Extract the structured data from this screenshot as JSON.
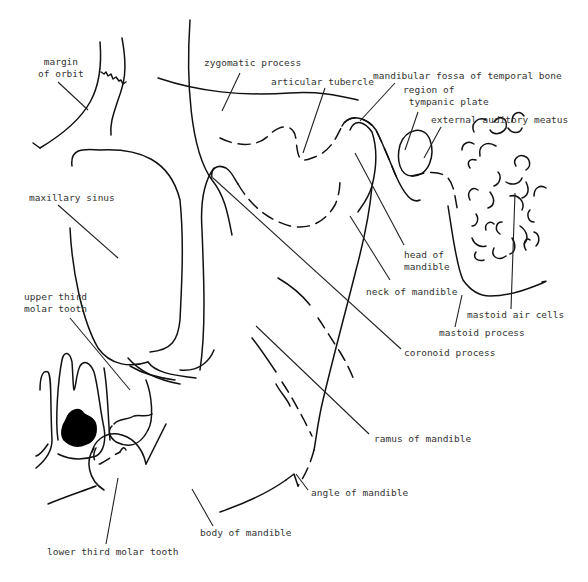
{
  "diagram": {
    "type": "anatomical-line-drawing",
    "line_color": "#111111",
    "text_color": "#333333",
    "background": "#ffffff"
  },
  "labels": {
    "margin_of_orbit": "margin\nof orbit",
    "zygomatic_process": "zygomatic process",
    "articular_tubercle": "articular tubercle",
    "mandibular_fossa": "mandibular fossa of temporal bone",
    "region_tympanic_plate": "region of\n tympanic plate",
    "external_auditory_meatus": "external auditory meatus",
    "maxillary_sinus": "maxillary sinus",
    "upper_third_molar": "upper third\nmolar tooth",
    "head_of_mandible": "head of\nmandible",
    "neck_of_mandible": "neck of mandible",
    "mastoid_air_cells": "mastoid air cells",
    "mastoid_process": "mastoid process",
    "coronoid_process": "coronoid process",
    "ramus_of_mandible": "ramus of mandible",
    "angle_of_mandible": "angle of mandible",
    "body_of_mandible": "body of mandible",
    "lower_third_molar": "lower third molar tooth"
  }
}
